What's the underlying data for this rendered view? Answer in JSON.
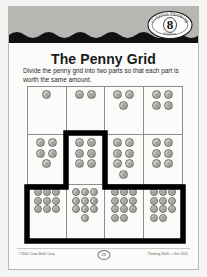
{
  "page": {
    "title": "The Penny Grid",
    "instructions": "Divide the penny grid into two parts so that each part is worth the same amount."
  },
  "seal": {
    "arc_top_text": "Creative Thinking",
    "number": "8",
    "arc_bottom_text": "Puzzles"
  },
  "footer": {
    "left_text": "©2001 Crow Math Corp.",
    "page_number": "23",
    "right_text": "Thinking Skills + Unit 1501"
  },
  "grid": {
    "columns": 4,
    "rows": 3,
    "cells": [
      {
        "row": 1,
        "col": 1,
        "pennies": 1,
        "in_region": false
      },
      {
        "row": 1,
        "col": 2,
        "pennies": 2,
        "in_region": false
      },
      {
        "row": 1,
        "col": 3,
        "pennies": 3,
        "in_region": false
      },
      {
        "row": 1,
        "col": 4,
        "pennies": 4,
        "in_region": false
      },
      {
        "row": 2,
        "col": 1,
        "pennies": 5,
        "in_region": false
      },
      {
        "row": 2,
        "col": 2,
        "pennies": 6,
        "in_region": true
      },
      {
        "row": 2,
        "col": 3,
        "pennies": 7,
        "in_region": false
      },
      {
        "row": 2,
        "col": 4,
        "pennies": 6,
        "in_region": false
      },
      {
        "row": 3,
        "col": 1,
        "pennies": 9,
        "in_region": false
      },
      {
        "row": 3,
        "col": 2,
        "pennies": 10,
        "in_region": true
      },
      {
        "row": 3,
        "col": 3,
        "pennies": 11,
        "in_region": true
      },
      {
        "row": 3,
        "col": 4,
        "pennies": 11,
        "in_region": true
      }
    ]
  },
  "colors": {
    "banner": "#b6b6b3",
    "wave": "#111111",
    "grid_line": "#8e8e8a",
    "partition_line": "#000000",
    "penny": "#bdbdb8",
    "paper": "#fbfbfa"
  }
}
